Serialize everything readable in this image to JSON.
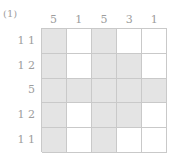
{
  "puzzle": {
    "label": "(1)",
    "type": "nonogram",
    "size": {
      "rows": 5,
      "cols": 5
    },
    "column_clues": [
      {
        "text": "5",
        "values": [
          5
        ]
      },
      {
        "text": "1",
        "values": [
          1
        ]
      },
      {
        "text": "5",
        "values": [
          5
        ]
      },
      {
        "text": "3",
        "values": [
          3
        ]
      },
      {
        "text": "1",
        "values": [
          1
        ]
      }
    ],
    "row_clues": [
      {
        "text": "1 1",
        "values": [
          1,
          1
        ]
      },
      {
        "text": "1 2",
        "values": [
          1,
          2
        ]
      },
      {
        "text": "5",
        "values": [
          5
        ]
      },
      {
        "text": "1 2",
        "values": [
          1,
          2
        ]
      },
      {
        "text": "1 1",
        "values": [
          1,
          1
        ]
      }
    ],
    "grid": [
      [
        1,
        0,
        1,
        0,
        0
      ],
      [
        1,
        0,
        1,
        1,
        0
      ],
      [
        1,
        1,
        1,
        1,
        1
      ],
      [
        1,
        0,
        1,
        1,
        0
      ],
      [
        1,
        0,
        1,
        0,
        0
      ]
    ],
    "colors": {
      "filled_cell": "#e4e4e4",
      "empty_cell": "#ffffff",
      "grid_line": "#c9c9c9",
      "clue_text": "#9d9d9d",
      "label_text": "#a0a0a0",
      "page_background": "#ffffff"
    }
  }
}
